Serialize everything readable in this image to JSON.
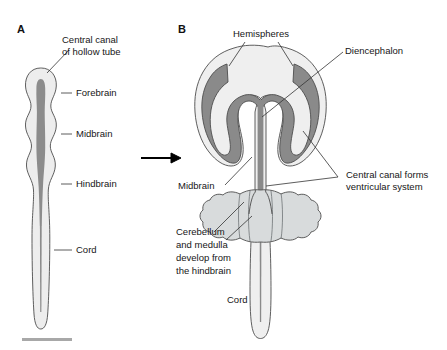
{
  "figure": {
    "background_color": "#ffffff",
    "width": 447,
    "height": 350
  },
  "colors": {
    "outline": "#4d4d4d",
    "tube_outer_fill": "#ededed",
    "canal_fill": "#8c8c8c",
    "brain_outer_fill": "#efefef",
    "brain_canal_fill": "#8a8a8a",
    "cerebellum_fill": "#d8dbdc",
    "text": "#161616",
    "leader_line": "#333333",
    "scale_bar": "#a8a8a8"
  },
  "panels": [
    {
      "id": "A",
      "letter": "A",
      "description": "Early hollow neural tube with central canal",
      "labels": [
        {
          "id": "central-canal",
          "text_lines": [
            "Central canal",
            "of hollow tube"
          ]
        },
        {
          "id": "forebrain",
          "text_lines": [
            "Forebrain"
          ]
        },
        {
          "id": "midbrain",
          "text_lines": [
            "Midbrain"
          ]
        },
        {
          "id": "hindbrain",
          "text_lines": [
            "Hindbrain"
          ]
        },
        {
          "id": "cord",
          "text_lines": [
            "Cord"
          ]
        }
      ]
    },
    {
      "id": "B",
      "letter": "B",
      "description": "Developed brain with hemispheres, diencephalon, cerebellum and cord",
      "labels": [
        {
          "id": "hemispheres",
          "text_lines": [
            "Hemispheres"
          ]
        },
        {
          "id": "diencephalon",
          "text_lines": [
            "Diencephalon"
          ]
        },
        {
          "id": "central-canal-ventricular",
          "text_lines": [
            "Central canal forms",
            "ventricular system"
          ]
        },
        {
          "id": "midbrain",
          "text_lines": [
            "Midbrain"
          ]
        },
        {
          "id": "cerebellum-medulla",
          "text_lines": [
            "Cerebellum",
            "and medulla",
            "develop from",
            "the hindbrain"
          ]
        },
        {
          "id": "cord",
          "text_lines": [
            "Cord"
          ]
        }
      ]
    }
  ],
  "panel_a_labels": {
    "central_canal_line1": "Central canal",
    "central_canal_line2": "of hollow tube",
    "forebrain": "Forebrain",
    "midbrain": "Midbrain",
    "hindbrain": "Hindbrain",
    "cord": "Cord"
  },
  "panel_b_labels": {
    "hemispheres": "Hemispheres",
    "diencephalon": "Diencephalon",
    "central_canal_line1": "Central canal forms",
    "central_canal_line2": "ventricular system",
    "midbrain": "Midbrain",
    "cerebellum_line1": "Cerebellum",
    "cerebellum_line2": "and medulla",
    "cerebellum_line3": "develop from",
    "cerebellum_line4": "the hindbrain",
    "cord": "Cord"
  },
  "panel_letters": {
    "a": "A",
    "b": "B"
  },
  "transition": {
    "symbol": "arrow-right",
    "meaning": "develops into"
  }
}
